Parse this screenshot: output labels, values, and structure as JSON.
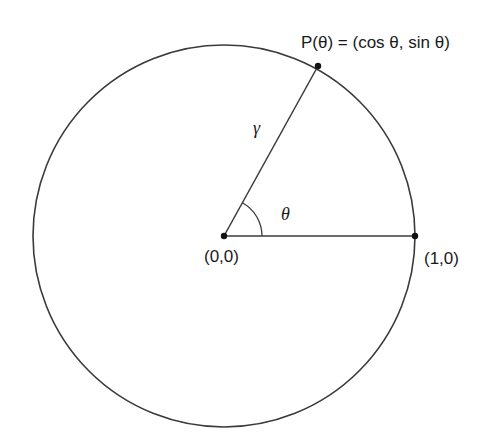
{
  "diagram": {
    "type": "unit-circle",
    "center": {
      "x": 224,
      "y": 236
    },
    "radius": 191,
    "angle_deg": 61,
    "stroke_color": "#3a3a3a",
    "labels": {
      "point_p": "P(θ) = (cos θ, sin θ)",
      "origin": "(0,0)",
      "unit_point": "(1,0)",
      "radius_symbol": "γ",
      "angle_symbol": "θ"
    },
    "points": [
      {
        "name": "origin",
        "label": "(0,0)",
        "x": 224,
        "y": 236
      },
      {
        "name": "unit-point",
        "label": "(1,0)",
        "x": 415,
        "y": 236
      },
      {
        "name": "point-p",
        "label": "P(θ) = (cos θ, sin θ)",
        "x": 318,
        "y": 66
      }
    ]
  }
}
